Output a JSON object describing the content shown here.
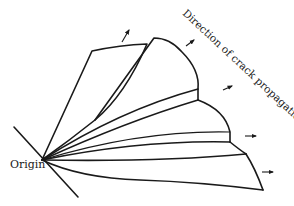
{
  "diagram": {
    "labels": {
      "origin": "Origin",
      "direction": "Direction of crack propagation"
    },
    "stroke_color": "#1a1a1a",
    "background": "#ffffff",
    "arrows": [
      {
        "name": "arrow-1",
        "from": [
          122,
          42
        ],
        "to": [
          130,
          29
        ]
      },
      {
        "name": "arrow-2",
        "from": [
          185,
          46
        ],
        "to": [
          195,
          40
        ]
      },
      {
        "name": "arrow-3",
        "from": [
          222,
          90
        ],
        "to": [
          233,
          85
        ]
      },
      {
        "name": "arrow-4",
        "from": [
          245,
          136
        ],
        "to": [
          257,
          136
        ]
      },
      {
        "name": "arrow-5",
        "from": [
          262,
          172
        ],
        "to": [
          274,
          172
        ]
      }
    ]
  }
}
